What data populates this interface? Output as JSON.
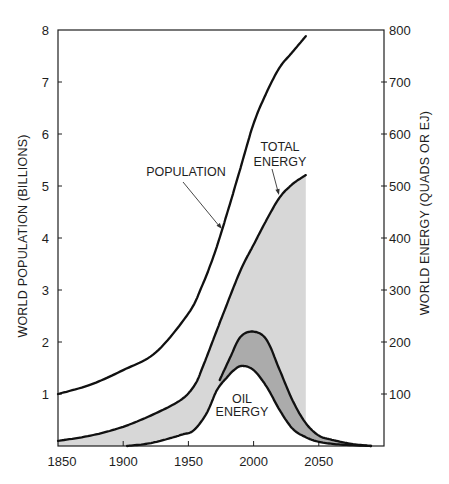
{
  "chart_data": {
    "type": "line",
    "title": "",
    "xlabel": "",
    "ylabel": "WORLD POPULATION (BILLIONS)",
    "ylabel_right": "WORLD ENERGY (QUADS OR EJ)",
    "xlim": [
      1850,
      2100
    ],
    "ylim": [
      0,
      8
    ],
    "ylim_right": [
      0,
      800
    ],
    "x_ticks": [
      1850,
      1900,
      1950,
      2000,
      2050
    ],
    "y_ticks": [
      1,
      2,
      3,
      4,
      5,
      6,
      7,
      8
    ],
    "y_ticks_right": [
      100,
      200,
      300,
      400,
      500,
      600,
      700,
      800
    ],
    "grid": false,
    "legend": "none (inline curve labels)",
    "series": [
      {
        "name": "Population",
        "axis": "left",
        "unit": "billions",
        "x": [
          1850,
          1875,
          1900,
          1925,
          1950,
          1960,
          1970,
          1980,
          1990,
          2000,
          2010,
          2020,
          2030,
          2040
        ],
        "y": [
          1.0,
          1.18,
          1.46,
          1.8,
          2.55,
          3.05,
          3.7,
          4.5,
          5.35,
          6.2,
          6.8,
          7.28,
          7.58,
          7.88
        ]
      },
      {
        "name": "Total Energy",
        "axis": "right",
        "unit": "quads",
        "x": [
          1850,
          1875,
          1900,
          1925,
          1945,
          1955,
          1961,
          1969,
          1977,
          1990,
          2000,
          2010,
          2020,
          2030,
          2040
        ],
        "y": [
          10,
          20,
          37,
          63,
          90,
          118,
          152,
          204,
          256,
          338,
          387,
          435,
          478,
          504,
          521
        ]
      },
      {
        "name": "Oil Energy",
        "axis": "right",
        "unit": "quads",
        "x": [
          1903,
          1920,
          1936,
          1945,
          1954,
          1964,
          1972,
          1980,
          1985,
          1991,
          2000,
          2010,
          2020,
          2030,
          2040,
          2050,
          2065,
          2090
        ],
        "y": [
          0,
          5,
          15,
          22,
          30,
          63,
          108,
          133,
          146,
          154,
          146,
          114,
          69,
          33,
          17,
          8,
          3,
          0
        ]
      },
      {
        "name": "Oil Energy (upper band edge)",
        "axis": "right",
        "unit": "quads",
        "x": [
          1974,
          1982,
          1990,
          2000,
          2010,
          2020,
          2030,
          2040,
          2050,
          2060,
          2075,
          2090
        ],
        "y": [
          127,
          170,
          210,
          220,
          204,
          146,
          87,
          44,
          20,
          12,
          4,
          0
        ]
      }
    ],
    "shading": {
      "light": "area under Total Energy from 1850 to 2040 (excluding area under Oil Energy)",
      "dark": "band between Oil Energy and upper band edge, 1974 to 2090"
    },
    "annotations": [
      {
        "target": "Population",
        "lines": [
          "POPULATION"
        ]
      },
      {
        "target": "Total Energy",
        "lines": [
          "TOTAL",
          "ENERGY"
        ]
      },
      {
        "target": "Oil Energy",
        "lines": [
          "OIL",
          "ENERGY"
        ]
      }
    ]
  },
  "colors": {
    "line": "#111111",
    "axis": "#1e1e1e",
    "light_fill": "#d7d7d7",
    "dark_fill": "#ababab",
    "background": "#ffffff"
  }
}
